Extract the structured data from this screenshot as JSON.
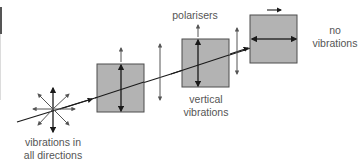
{
  "diagram": {
    "labels": {
      "unpolarised": [
        "vibrations in",
        "all directions"
      ],
      "polarisers": "polarisers",
      "vertical": [
        "vertical",
        "vibrations"
      ],
      "none": [
        "no",
        "vibrations"
      ]
    },
    "colors": {
      "filter_fill": "#b3b3b3",
      "filter_stroke": "#4d4d4d",
      "arrow": "#1a1a1a",
      "arrow_light": "#555555",
      "text": "#555555"
    },
    "elements": {
      "source": "star of arrows (unpolarised light)",
      "polariser_1": "vertical transmission axis",
      "polariser_2": "vertical transmission axis",
      "polariser_3": "horizontal transmission axis"
    }
  }
}
